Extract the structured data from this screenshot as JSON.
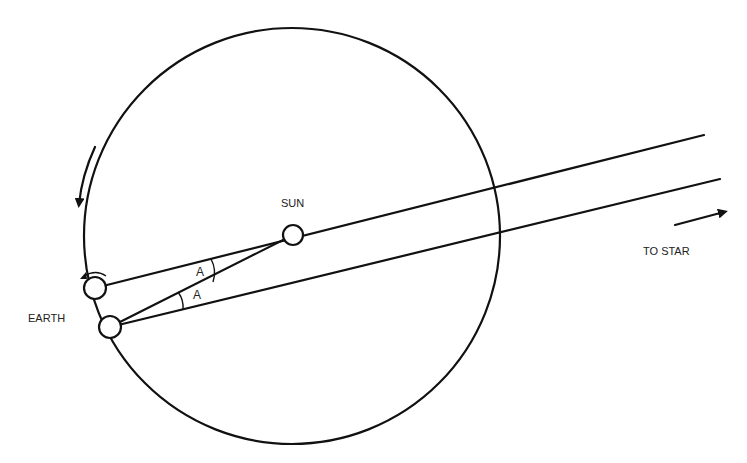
{
  "diagram": {
    "labels": {
      "sun": "SUN",
      "earth": "EARTH",
      "to_star": "TO STAR",
      "angle_upper": "A",
      "angle_lower": "A"
    },
    "nodes": [
      {
        "id": "sun",
        "label": "SUN"
      },
      {
        "id": "earth-position-1",
        "label": ""
      },
      {
        "id": "earth-position-2",
        "label": "EARTH"
      },
      {
        "id": "orbit",
        "label": ""
      }
    ],
    "edges": [
      {
        "from": "earth-position-1",
        "to": "star",
        "via": "sun"
      },
      {
        "from": "earth-position-2",
        "to": "star"
      },
      {
        "from": "earth-position-2",
        "to": "sun"
      }
    ],
    "annotations": {
      "orbit_direction": "counterclockwise",
      "equal_angles": "A"
    },
    "colors": {
      "ink": "#111111",
      "background": "#ffffff"
    }
  }
}
